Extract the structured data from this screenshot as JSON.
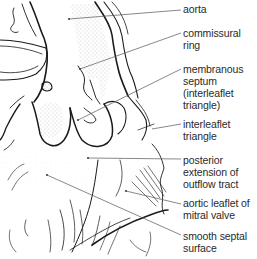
{
  "figure": {
    "type": "anatomical line drawing"
  },
  "labels": [
    {
      "id": "aorta",
      "lines": [
        "aorta"
      ],
      "top": 3,
      "pointer_from": [
        69,
        19
      ],
      "pointer_to": [
        181,
        10
      ]
    },
    {
      "id": "commissural-ring",
      "lines": [
        "commissural",
        "ring"
      ],
      "top": 27,
      "pointer_from": [
        80,
        69
      ],
      "pointer_to": [
        181,
        33
      ]
    },
    {
      "id": "membranous-septum",
      "lines": [
        "membranous",
        "septum",
        "(interleaflet",
        "triangle)"
      ],
      "top": 63,
      "pointer_from": [
        78,
        120
      ],
      "pointer_to": [
        181,
        69
      ]
    },
    {
      "id": "interleaflet-triangle",
      "lines": [
        "interleaflet",
        "triangle"
      ],
      "top": 118,
      "pointer_from": [
        152,
        129
      ],
      "pointer_to": [
        181,
        124
      ]
    },
    {
      "id": "posterior-extension",
      "lines": [
        "posterior",
        "extension of",
        "outflow tract"
      ],
      "top": 154,
      "pointer_from": [
        88,
        158
      ],
      "pointer_to": [
        181,
        159
      ]
    },
    {
      "id": "aortic-leaflet",
      "lines": [
        "aortic leaflet of",
        "mitral valve"
      ],
      "top": 197,
      "pointer_from": [
        126,
        191
      ],
      "pointer_to": [
        181,
        204
      ]
    },
    {
      "id": "smooth-septal-surface",
      "lines": [
        "smooth septal",
        "surface"
      ],
      "top": 230,
      "pointer_from": [
        47,
        175
      ],
      "pointer_to": [
        181,
        235
      ]
    }
  ],
  "colors": {
    "ink": "#1a1a1a",
    "leader": "#555555",
    "stipple": "#bdbdbd",
    "text": "#2a2a2a"
  }
}
